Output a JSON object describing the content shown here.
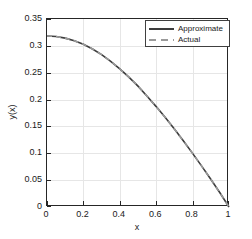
{
  "chart_data": {
    "type": "line",
    "title": "",
    "xlabel": "x",
    "ylabel": "y(x)",
    "xlim": [
      0,
      1
    ],
    "ylim": [
      0,
      0.35
    ],
    "grid": true,
    "legend_position": "top-right",
    "xticks": [
      "0",
      "0.2",
      "0.4",
      "0.6",
      "0.8",
      "1"
    ],
    "xtick_values": [
      0,
      0.2,
      0.4,
      0.6,
      0.8,
      1
    ],
    "yticks": [
      "0",
      "0.05",
      "0.1",
      "0.15",
      "0.2",
      "0.25",
      "0.3",
      "0.35"
    ],
    "ytick_values": [
      0,
      0.05,
      0.1,
      0.15,
      0.2,
      0.25,
      0.3,
      0.35
    ],
    "x": [
      0,
      0.05,
      0.1,
      0.15,
      0.2,
      0.25,
      0.3,
      0.35,
      0.4,
      0.45,
      0.5,
      0.55,
      0.6,
      0.65,
      0.7,
      0.75,
      0.8,
      0.85,
      0.9,
      0.95,
      1
    ],
    "series": [
      {
        "name": "Approximate",
        "style": "solid",
        "color": "#3d3d3d",
        "values": [
          0.3183,
          0.3173,
          0.3144,
          0.3096,
          0.3028,
          0.2941,
          0.2836,
          0.2713,
          0.2573,
          0.2417,
          0.225,
          0.2061,
          0.1869,
          0.1665,
          0.1451,
          0.1228,
          0.0998,
          0.0761,
          0.0517,
          0.0264,
          0.0
        ]
      },
      {
        "name": "Actual",
        "style": "dashed",
        "color": "#9a9a9a",
        "values": [
          0.3183,
          0.3173,
          0.3144,
          0.3096,
          0.3028,
          0.2941,
          0.2836,
          0.2713,
          0.2573,
          0.2417,
          0.225,
          0.2061,
          0.1869,
          0.1665,
          0.1451,
          0.1228,
          0.0998,
          0.0761,
          0.0517,
          0.0264,
          0.0
        ]
      }
    ]
  },
  "legend": {
    "entries": [
      {
        "label": "Approximate"
      },
      {
        "label": "Actual"
      }
    ]
  },
  "axes": {
    "x_title": "x",
    "y_title": "y(x)"
  },
  "colors": {
    "axis": "#262626",
    "grid": "#e6e6e6",
    "approximate": "#3d3d3d",
    "actual": "#9a9a9a",
    "background": "#ffffff"
  }
}
